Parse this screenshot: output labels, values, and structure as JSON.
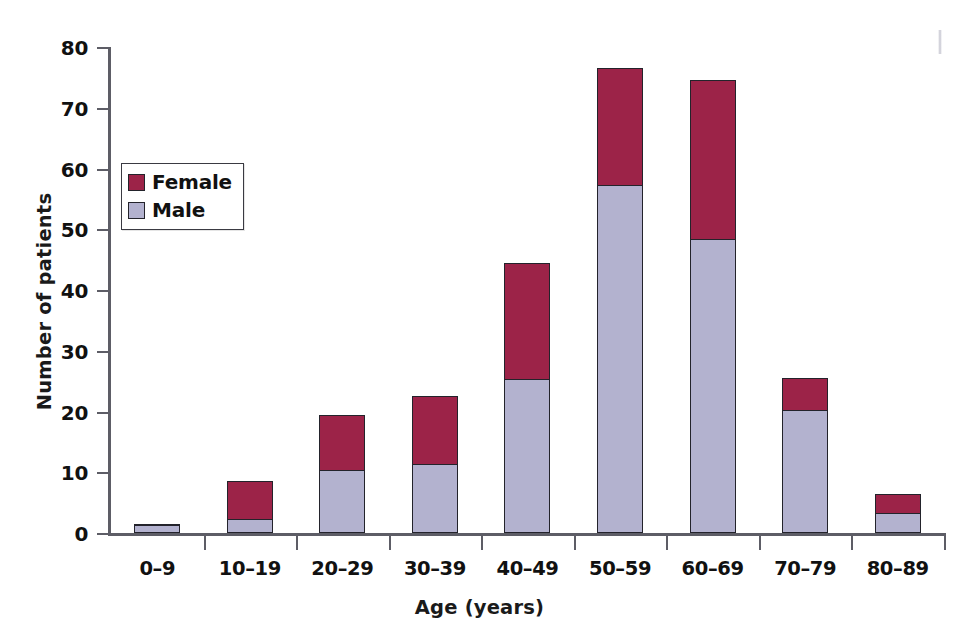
{
  "chart_data": {
    "type": "bar",
    "subtype": "stacked-vertical-bar",
    "title": "",
    "xlabel": "Age (years)",
    "ylabel": "Number of patients",
    "categories": [
      "0–9",
      "10–19",
      "20–29",
      "30–39",
      "40–49",
      "50–59",
      "60–69",
      "70–79",
      "80–89"
    ],
    "series": [
      {
        "name": "Male",
        "color": "#b3b2cf",
        "values": [
          1,
          2,
          10,
          11,
          25,
          57,
          48,
          20,
          3
        ]
      },
      {
        "name": "Female",
        "color": "#9c2348",
        "values": [
          0,
          6,
          9,
          11,
          19,
          19,
          26,
          5,
          3
        ]
      }
    ],
    "stack_order_bottom_to_top": [
      "Male",
      "Female"
    ],
    "totals": [
      1,
      8,
      19,
      22,
      44,
      76,
      74,
      25,
      6
    ],
    "ylim": [
      0,
      80
    ],
    "ytick_values": [
      0,
      10,
      20,
      30,
      40,
      50,
      60,
      70,
      80
    ],
    "ytick_labels": [
      "0",
      "10",
      "20",
      "30",
      "40",
      "50",
      "60",
      "70",
      "80"
    ],
    "grid": false,
    "legend_position": "upper-left-inside",
    "legend_entries": [
      "Female",
      "Male"
    ],
    "annotations": []
  },
  "legend": {
    "items": [
      {
        "label": "Female",
        "swatch_class": "female"
      },
      {
        "label": "Male",
        "swatch_class": "male"
      }
    ]
  },
  "colors": {
    "female": "#9c2348",
    "male": "#b3b2cf",
    "axis": "#5d5d66",
    "text": "#111111",
    "bar_outline": "#23232b",
    "background": "#ffffff"
  }
}
